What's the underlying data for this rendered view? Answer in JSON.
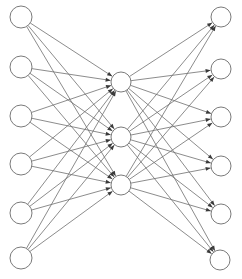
{
  "diagram": {
    "type": "neural-network",
    "colors": {
      "edge": "#6e6e6e",
      "arrowhead": "#3a3a3a",
      "node_stroke": "#7a7a7a",
      "node_fill": "#ffffff",
      "background": "#ffffff"
    },
    "layers": [
      {
        "name": "input",
        "radius": 11,
        "nodes": [
          {
            "id": "i1",
            "x": 21,
            "y": 17
          },
          {
            "id": "i2",
            "x": 21,
            "y": 67
          },
          {
            "id": "i3",
            "x": 21,
            "y": 116
          },
          {
            "id": "i4",
            "x": 21,
            "y": 164
          },
          {
            "id": "i5",
            "x": 21,
            "y": 213
          },
          {
            "id": "i6",
            "x": 21,
            "y": 258
          }
        ]
      },
      {
        "name": "hidden",
        "radius": 10,
        "nodes": [
          {
            "id": "h1",
            "x": 121,
            "y": 82
          },
          {
            "id": "h2",
            "x": 121,
            "y": 137
          },
          {
            "id": "h3",
            "x": 121,
            "y": 185
          }
        ]
      },
      {
        "name": "output",
        "radius": 10,
        "nodes": [
          {
            "id": "o1",
            "x": 221,
            "y": 17
          },
          {
            "id": "o2",
            "x": 221,
            "y": 69
          },
          {
            "id": "o3",
            "x": 221,
            "y": 117
          },
          {
            "id": "o4",
            "x": 221,
            "y": 166
          },
          {
            "id": "o5",
            "x": 221,
            "y": 214
          },
          {
            "id": "o6",
            "x": 220,
            "y": 260
          }
        ]
      }
    ],
    "connections": "fully-connected between consecutive layers, arrowheads at target node"
  }
}
